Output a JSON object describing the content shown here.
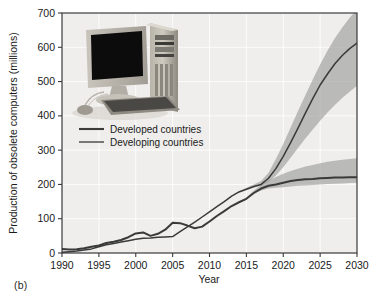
{
  "caption": "(b)",
  "inset_image": {
    "alt": "desktop computer with monitor, tower, keyboard and mouse",
    "icon": "desktop-computer-photo"
  },
  "chart_data": {
    "type": "line",
    "title": "",
    "xlabel": "Year",
    "ylabel": "Production of obsolete computers (millions)",
    "xlim": [
      1990,
      2030
    ],
    "ylim": [
      0,
      700
    ],
    "xticks": [
      1990,
      1995,
      2000,
      2005,
      2010,
      2015,
      2020,
      2025,
      2030
    ],
    "yticks": [
      0,
      100,
      200,
      300,
      400,
      500,
      600,
      700
    ],
    "grid": true,
    "legend_position": "upper-left",
    "plot_bg": "#efeeec",
    "band_color": "#9a9a9a",
    "line_color": "#3a3a3a",
    "x": [
      1990,
      1991,
      1992,
      1993,
      1994,
      1995,
      1996,
      1997,
      1998,
      1999,
      2000,
      2001,
      2002,
      2003,
      2004,
      2005,
      2006,
      2007,
      2008,
      2009,
      2010,
      2011,
      2012,
      2013,
      2014,
      2015,
      2016,
      2017,
      2018,
      2019,
      2020,
      2021,
      2022,
      2023,
      2024,
      2025,
      2026,
      2027,
      2028,
      2029,
      2030
    ],
    "series": [
      {
        "name": "Developed countries",
        "values": [
          12,
          10,
          11,
          14,
          18,
          22,
          29,
          33,
          38,
          46,
          57,
          60,
          50,
          56,
          68,
          88,
          87,
          80,
          72,
          77,
          92,
          108,
          122,
          137,
          148,
          158,
          175,
          188,
          196,
          200,
          205,
          210,
          213,
          215,
          216,
          218,
          219,
          220,
          220,
          221,
          221
        ],
        "band_low": [
          12,
          10,
          11,
          14,
          18,
          22,
          29,
          33,
          38,
          46,
          57,
          60,
          50,
          56,
          68,
          88,
          87,
          80,
          72,
          77,
          92,
          108,
          122,
          137,
          148,
          158,
          172,
          182,
          188,
          190,
          192,
          194,
          196,
          197,
          198,
          200,
          201,
          202,
          203,
          204,
          205
        ],
        "band_high": [
          12,
          10,
          11,
          14,
          18,
          22,
          29,
          33,
          38,
          46,
          57,
          60,
          50,
          56,
          68,
          88,
          87,
          80,
          72,
          77,
          92,
          108,
          122,
          137,
          150,
          162,
          182,
          198,
          212,
          222,
          231,
          239,
          246,
          252,
          257,
          262,
          266,
          269,
          272,
          274,
          276
        ]
      },
      {
        "name": "Developing countries",
        "values": [
          2,
          4,
          6,
          9,
          12,
          18,
          24,
          28,
          32,
          36,
          40,
          43,
          44,
          46,
          47,
          48,
          62,
          76,
          90,
          105,
          120,
          135,
          150,
          166,
          178,
          186,
          194,
          200,
          218,
          246,
          282,
          322,
          364,
          408,
          450,
          490,
          522,
          552,
          576,
          596,
          612
        ],
        "band_low": [
          2,
          4,
          6,
          9,
          12,
          18,
          24,
          28,
          32,
          36,
          40,
          43,
          44,
          46,
          47,
          48,
          62,
          76,
          90,
          105,
          120,
          135,
          150,
          166,
          178,
          184,
          190,
          196,
          208,
          226,
          250,
          278,
          306,
          334,
          360,
          386,
          410,
          432,
          452,
          470,
          488
        ],
        "band_high": [
          2,
          4,
          6,
          9,
          12,
          18,
          24,
          28,
          32,
          36,
          40,
          43,
          44,
          46,
          47,
          48,
          62,
          76,
          90,
          105,
          120,
          135,
          150,
          166,
          180,
          190,
          200,
          210,
          234,
          274,
          318,
          366,
          414,
          460,
          506,
          550,
          590,
          626,
          658,
          686,
          710
        ]
      }
    ]
  }
}
